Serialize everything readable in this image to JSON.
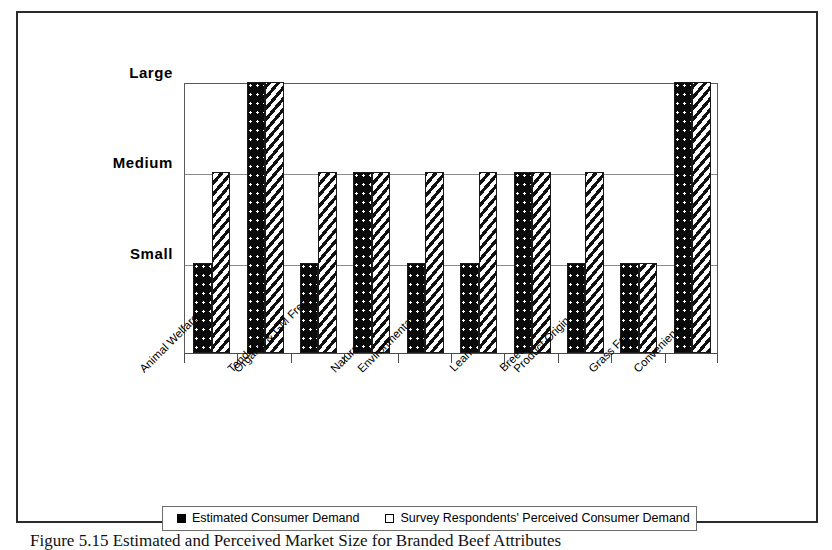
{
  "chart_data": {
    "type": "bar",
    "title": "",
    "xlabel": "",
    "ylabel": "",
    "grid": true,
    "legend_position": "bottom",
    "y_tick_labels": [
      "Small",
      "Medium",
      "Large"
    ],
    "y_scale_values": [
      1,
      2,
      3
    ],
    "ylim": [
      0,
      3
    ],
    "categories": [
      "Animal Welfare",
      "Tender",
      "Organic & GM Free",
      "Natural",
      "Environmental",
      "Lean",
      "Breed",
      "Product Origin",
      "Grass Fed",
      "Convenience"
    ],
    "series": [
      {
        "name": "Estimated Consumer Demand",
        "pattern": "black-with-white-dots",
        "values": [
          1,
          3,
          1,
          2,
          1,
          1,
          2,
          1,
          1,
          3
        ],
        "value_labels": [
          "Small",
          "Large",
          "Small",
          "Medium",
          "Small",
          "Small",
          "Medium",
          "Small",
          "Small",
          "Large"
        ]
      },
      {
        "name": "Survey Respondents' Perceived Consumer Demand",
        "pattern": "white-with-diagonal-stripes",
        "values": [
          2,
          3,
          2,
          2,
          2,
          2,
          2,
          2,
          1,
          3
        ],
        "value_labels": [
          "Medium",
          "Large",
          "Medium",
          "Medium",
          "Medium",
          "Medium",
          "Medium",
          "Medium",
          "Small",
          "Large"
        ]
      }
    ]
  },
  "legend": {
    "entries": [
      {
        "label": "Estimated Consumer Demand"
      },
      {
        "label": "Survey Respondents' Perceived Consumer Demand"
      }
    ]
  },
  "caption": {
    "text": "Figure 5.15  Estimated and Perceived Market Size for Branded Beef Attributes"
  }
}
